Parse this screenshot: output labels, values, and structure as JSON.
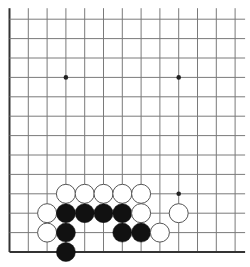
{
  "board": {
    "size": 13,
    "visible_region": "bottom-left corner (left and bottom edges shown)",
    "origin_px": {
      "x": 9.5,
      "y": 252
    },
    "spacing_px": {
      "x": 18.8,
      "y": 19.4
    },
    "cols": 13,
    "rows": 13,
    "line_extension_px": {
      "top": 11,
      "right": 10
    },
    "colors": {
      "background": "#ffffff",
      "grid_line": "#7a7a7a",
      "edge_line": "#333333",
      "hoshi": "#222222",
      "black_stone": "#111111",
      "white_stone_fill": "#ffffff",
      "white_stone_stroke": "#555555"
    },
    "stone_radius_px": 9.5,
    "hoshi": [
      {
        "col": 3,
        "row": 9
      },
      {
        "col": 9,
        "row": 9
      },
      {
        "col": 9,
        "row": 3
      }
    ],
    "stones": [
      {
        "color": "white",
        "col": 3,
        "row": 3
      },
      {
        "color": "white",
        "col": 4,
        "row": 3
      },
      {
        "color": "white",
        "col": 5,
        "row": 3
      },
      {
        "color": "white",
        "col": 6,
        "row": 3
      },
      {
        "color": "white",
        "col": 7,
        "row": 3
      },
      {
        "color": "white",
        "col": 2,
        "row": 2
      },
      {
        "color": "black",
        "col": 3,
        "row": 2
      },
      {
        "color": "black",
        "col": 4,
        "row": 2
      },
      {
        "color": "black",
        "col": 5,
        "row": 2
      },
      {
        "color": "black",
        "col": 6,
        "row": 2
      },
      {
        "color": "white",
        "col": 7,
        "row": 2
      },
      {
        "color": "white",
        "col": 9,
        "row": 2
      },
      {
        "color": "white",
        "col": 2,
        "row": 1
      },
      {
        "color": "black",
        "col": 3,
        "row": 1
      },
      {
        "color": "black",
        "col": 6,
        "row": 1
      },
      {
        "color": "black",
        "col": 7,
        "row": 1
      },
      {
        "color": "white",
        "col": 8,
        "row": 1
      },
      {
        "color": "black",
        "col": 3,
        "row": 0
      }
    ]
  }
}
